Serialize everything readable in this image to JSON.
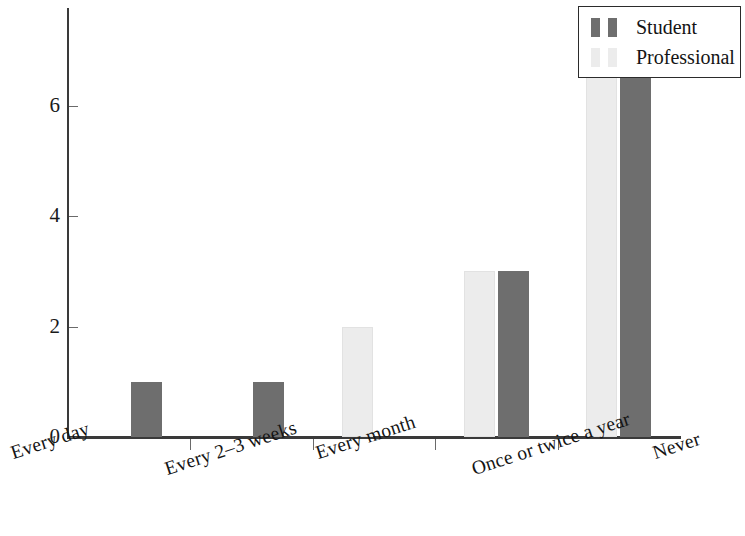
{
  "chart_data": {
    "type": "bar",
    "title": "",
    "subtitle": "",
    "xlabel": "",
    "ylabel": "",
    "categories": [
      "Every day",
      "Every 2–3 weeks",
      "Every month",
      "Once or twice a year",
      "Never"
    ],
    "series": [
      {
        "name": "Student",
        "color": "#ececec",
        "values": [
          0,
          0,
          2,
          3,
          7
        ]
      },
      {
        "name": "Professional",
        "color": "#6e6e6e",
        "values": [
          1,
          1,
          0,
          3,
          7
        ]
      }
    ],
    "ylim": [
      0,
      7.6
    ],
    "yticks": [
      0,
      2,
      4,
      6
    ],
    "ytick_labels": [
      "0",
      "2",
      "4",
      "6"
    ],
    "grid": false,
    "legend_position": "top-right",
    "legend_entries": [
      {
        "label": "Student",
        "swatch_color": "#6e6e6e"
      },
      {
        "label": "Professional",
        "swatch_color": "#ececec"
      }
    ],
    "axis_color": "#3a3a3a",
    "background_color": "#ffffff",
    "bar_edge_color": "#cfcfcf",
    "xtick_label_rotation": "-18"
  },
  "figure": {
    "plot_left_px": 68,
    "plot_top_px": 8,
    "plot_width_px": 612,
    "plot_height_px": 429,
    "baseline_y_px": 437,
    "pixels_per_unit": 55.2
  }
}
